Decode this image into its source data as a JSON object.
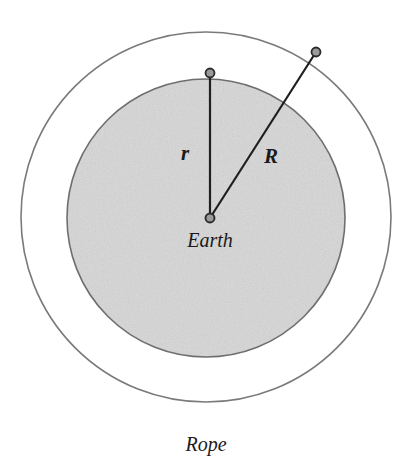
{
  "diagram": {
    "background_color": "#ffffff",
    "labels": {
      "inner_radius": "r",
      "outer_radius": "R",
      "center_body": "Earth",
      "outer_circle": "Rope"
    },
    "colors": {
      "earth_fill": "#d9d9d9",
      "earth_stroke": "#6e6e6e",
      "rope_stroke": "#7a7a7a",
      "radius_line": "#1f1f1f",
      "marker_fill": "#9a9a9a",
      "marker_stroke": "#2b2b2b",
      "text": "#1a1a1a"
    },
    "geometry": {
      "center": {
        "x": 210,
        "y": 218
      },
      "earth_circle": {
        "cx": 206,
        "cy": 218,
        "r": 139
      },
      "rope_circle": {
        "cx": 206,
        "cy": 217,
        "r": 185
      },
      "inner_radius_endpoint": {
        "x": 210,
        "y": 73
      },
      "outer_radius_endpoint": {
        "x": 316,
        "y": 52
      },
      "marker_radius": 4.5
    },
    "label_positions": {
      "inner_radius": {
        "x": 185,
        "y": 160
      },
      "outer_radius": {
        "x": 271,
        "y": 163
      },
      "center_body": {
        "x": 210,
        "y": 247
      },
      "outer_circle": {
        "x": 206,
        "y": 451
      }
    },
    "label_font_sizes": {
      "inner_radius": 21,
      "outer_radius": 21,
      "center_body": 20,
      "outer_circle": 20
    }
  }
}
